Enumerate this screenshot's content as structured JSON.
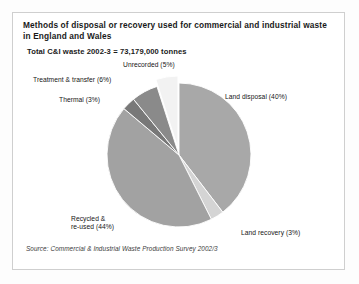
{
  "chart": {
    "title": "Methods of disposal or recovery used for commercial and industrial waste in England and Wales",
    "subtitle": "Total C&I waste 2002-3 = 73,179,000 tonnes",
    "source": "Source: Commercial & Industrial Waste Production Survey 2002/3",
    "labels": {
      "land_disposal": "Land disposal (40%)",
      "land_recovery": "Land recovery (3%)",
      "recycled": "Recycled &\nre-used (44%)",
      "thermal": "Thermal (3%)",
      "treatment": "Treatment & transfer  (6%)",
      "unrecorded": "Unrecorded (5%)"
    }
  },
  "chart_data": {
    "type": "pie",
    "title": "Methods of disposal or recovery used for commercial and industrial waste in England and Wales",
    "subtitle": "Total C&I waste 2002-3 = 73,179,000 tonnes",
    "source": "Source: Commercial & Industrial Waste Production Survey 2002/3",
    "total_label": "Total C&I waste 2002-3 = 73,179,000 tonnes",
    "total_tonnes": 73179000,
    "units": "tonnes",
    "categories": [
      "Land disposal",
      "Land recovery",
      "Recycled & re-used",
      "Thermal",
      "Treatment & transfer",
      "Unrecorded"
    ],
    "values": [
      40,
      3,
      44,
      3,
      6,
      5
    ],
    "value_unit": "percent",
    "colors": [
      "#a8a8a8",
      "#d4d4d4",
      "#a2a2a2",
      "#787878",
      "#8a8a8a",
      "#f2f2f2"
    ],
    "start_angle_deg": 0,
    "direction": "clockwise",
    "exploded_slices": [
      "Unrecorded"
    ],
    "legend": "none",
    "labels_position": "outside",
    "grid": false
  }
}
